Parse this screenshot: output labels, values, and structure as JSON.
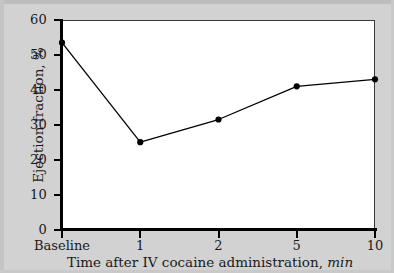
{
  "chart_data": {
    "type": "line",
    "title": "",
    "xlabel": "Time after IV cocaine administration, min",
    "xlabel_main": "Time after IV cocaine administration,",
    "xlabel_unit": "min",
    "ylabel": "Ejection fraction, %",
    "categories": [
      "Baseline",
      "1",
      "2",
      "5",
      "10"
    ],
    "values": [
      53.5,
      25,
      31.5,
      41,
      43
    ],
    "series": [
      {
        "name": "Ejection fraction",
        "values": [
          53.5,
          25,
          31.5,
          41,
          43
        ]
      }
    ],
    "ylim": [
      0,
      60
    ],
    "yticks": [
      0,
      10,
      20,
      30,
      40,
      50,
      60
    ],
    "ytick_labels": [
      "0",
      "10",
      "20",
      "30",
      "40",
      "50",
      "60"
    ],
    "xtick_labels": [
      "Baseline",
      "1",
      "2",
      "5",
      "10"
    ],
    "grid": false,
    "legend": false,
    "legend_position": "none",
    "marker": "filled-circle",
    "line_color": "#000000",
    "marker_color": "#000000",
    "plot_background": "#ffffff",
    "figure_background": "#d2d2d2"
  }
}
